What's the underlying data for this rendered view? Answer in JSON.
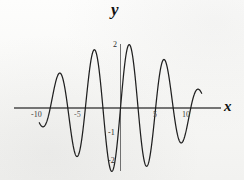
{
  "figure": {
    "kind": "cartesian-plot",
    "background_color": "#fbfbfa",
    "curve_color": "#1f1f1f",
    "axis_color": "#4a4a4a"
  },
  "axes": {
    "x_title": "x",
    "y_title": "y",
    "x_ticks": [
      {
        "value": -10,
        "label": "-10"
      },
      {
        "value": -5,
        "label": "-5"
      },
      {
        "value": 5,
        "label": "5"
      },
      {
        "value": 10,
        "label": "10"
      }
    ],
    "y_ticks": [
      {
        "value": 2,
        "label": "2"
      },
      {
        "value": -1,
        "label": "-1"
      },
      {
        "value": -2,
        "label": "-2"
      }
    ]
  },
  "chart_data": {
    "type": "line",
    "title": "",
    "xlabel": "x",
    "ylabel": "y",
    "xlim": [
      -13.2,
      13.2
    ],
    "ylim": [
      -2.6,
      2.35
    ],
    "grid": false,
    "legend": null,
    "xticks": [
      -10,
      -5,
      5,
      10
    ],
    "xticklabels": [
      "-10",
      "-5",
      "5",
      "10"
    ],
    "yticks": [
      2,
      -1,
      -2
    ],
    "yticklabels": [
      "2",
      "-1",
      "-2"
    ],
    "series": [
      {
        "name": "y = sin(x) + sin(1.2x)",
        "formula_terms": [
          {
            "amplitude": 1.0,
            "frequency": 1.0,
            "phase": 0
          },
          {
            "amplitude": 1.0,
            "frequency": 1.2,
            "phase": 0
          }
        ],
        "x": [
          -13.2,
          -12.8,
          -12.4,
          -12.0,
          -11.6,
          -11.2,
          -10.8,
          -10.4,
          -10.0,
          -9.6,
          -9.2,
          -8.8,
          -8.4,
          -8.0,
          -7.6,
          -7.2,
          -6.8,
          -6.4,
          -6.0,
          -5.6,
          -5.2,
          -4.8,
          -4.4,
          -4.0,
          -3.6,
          -3.2,
          -2.8,
          -2.4,
          -2.0,
          -1.6,
          -1.2,
          -0.8,
          -0.4,
          0.0,
          0.4,
          0.8,
          1.2,
          1.6,
          2.0,
          2.4,
          2.8,
          3.2,
          3.6,
          4.0,
          4.4,
          4.8,
          5.2,
          5.6,
          6.0,
          6.4,
          6.8,
          7.2,
          7.6,
          8.0,
          8.4,
          8.8,
          9.2,
          9.6,
          10.0,
          10.4,
          10.8,
          11.2,
          11.6,
          12.0,
          12.4,
          12.8,
          13.2
        ],
        "y": [
          1.96,
          1.1,
          0.04,
          -0.99,
          -1.7,
          -1.92,
          -1.62,
          -0.92,
          -0.03,
          0.8,
          1.35,
          1.48,
          1.2,
          0.62,
          -0.06,
          -0.66,
          -1.02,
          -1.07,
          -0.84,
          -0.44,
          0.0,
          0.38,
          0.62,
          0.72,
          0.72,
          0.71,
          0.78,
          1.0,
          1.36,
          1.77,
          2.08,
          2.1,
          1.72,
          0.0,
          -1.72,
          -2.1,
          -2.08,
          -1.77,
          -1.36,
          -1.0,
          -0.78,
          -0.71,
          -0.72,
          -0.72,
          -0.62,
          -0.38,
          0.0,
          0.44,
          0.84,
          1.07,
          1.02,
          0.66,
          0.06,
          -0.62,
          -1.2,
          -1.48,
          -1.35,
          -0.8,
          0.03,
          0.92,
          1.62,
          1.92,
          1.7,
          0.99,
          -0.04,
          -1.1,
          -1.96
        ]
      }
    ],
    "annotations": [
      {
        "text": "2",
        "x": 0,
        "y": 2,
        "role": "y-tick"
      },
      {
        "text": "-1",
        "x": 0,
        "y": -1,
        "role": "y-tick"
      },
      {
        "text": "-2",
        "x": 0,
        "y": -2,
        "role": "y-tick"
      },
      {
        "text": "-10",
        "x": -10,
        "y": 0,
        "role": "x-tick"
      },
      {
        "text": "-5",
        "x": -5,
        "y": 0,
        "role": "x-tick"
      },
      {
        "text": "5",
        "x": 5,
        "y": 0,
        "role": "x-tick"
      },
      {
        "text": "10",
        "x": 10,
        "y": 0,
        "role": "x-tick"
      }
    ]
  }
}
